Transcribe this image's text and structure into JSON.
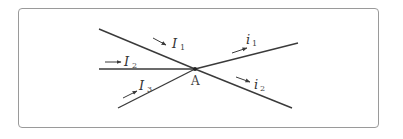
{
  "diagram": {
    "type": "current-junction",
    "node_label": "A",
    "incoming": [
      {
        "name": "I",
        "sub": "1"
      },
      {
        "name": "I",
        "sub": "2"
      },
      {
        "name": "I",
        "sub": "3"
      }
    ],
    "outgoing": [
      {
        "name": "i",
        "sub": "1"
      },
      {
        "name": "i",
        "sub": "2"
      }
    ],
    "colors": {
      "line": "#3a3a3a",
      "frame": "#9a9a9a"
    }
  }
}
